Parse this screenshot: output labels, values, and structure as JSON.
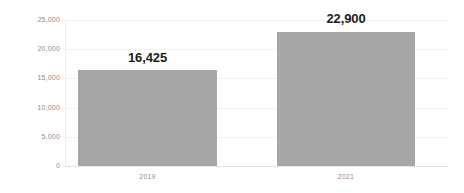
{
  "chart_data": {
    "type": "bar",
    "title": "",
    "subtitle": "",
    "xlabel": "",
    "ylabel": "",
    "categories": [
      "2019",
      "2021"
    ],
    "values": [
      16425,
      22900
    ],
    "data_labels": [
      "16,425",
      "22,900"
    ],
    "series": [
      {
        "name": "",
        "values": [
          16425,
          22900
        ],
        "color": "#a6a6a6"
      }
    ],
    "ylim": [
      0,
      25000
    ],
    "y_ticks": [
      0,
      5000,
      10000,
      15000,
      20000,
      25000
    ],
    "y_tick_labels": [
      "0",
      "5,000",
      "10,000",
      "15,000",
      "20,000",
      "25,000"
    ],
    "grid": true,
    "grid_axis": "y",
    "legend": false,
    "legend_position": "none",
    "background_color": "#ffffff",
    "bar_color": "#a6a6a6",
    "gridline_color": "#f1f1f1",
    "axis_color": "#e3e3e3",
    "tick_label_color": "#8c8c8c",
    "data_label_color": "#1c1c1c"
  }
}
